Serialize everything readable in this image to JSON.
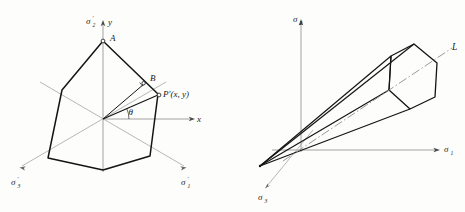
{
  "figure": {
    "background_color": "#fdfdfc",
    "stroke_color": "#1a1a1a",
    "axis_color": "#8a8a8a",
    "construction_color": "#9a9a9a",
    "dashdot_color": "#8d8d8d"
  },
  "left_panel": {
    "name": "deviatoric-pi-plane-hexagon",
    "labels": {
      "sigma2_prime": "σ",
      "sigma2_prime_sub": "2",
      "sigma2_prime_prime_mark": "′",
      "y_axis": "y",
      "x_axis": "x",
      "vertex_A": "A",
      "point_B": "B",
      "point_P": "P′(x, y)",
      "angle_theta": "θ",
      "sigma1_prime": "σ",
      "sigma1_prime_sub": "1",
      "sigma3_prime": "σ",
      "sigma3_prime_sub": "3",
      "prime_mark": "′"
    },
    "axis_labels": [
      {
        "key": "sigma2p",
        "base": "σ",
        "sub": "2",
        "prime": "′"
      },
      {
        "key": "sigma1p",
        "base": "σ",
        "sub": "1",
        "prime": "′"
      },
      {
        "key": "sigma3p",
        "base": "σ",
        "sub": "3",
        "prime": "′"
      }
    ],
    "hexagon_vertices": [
      {
        "x": 103,
        "y": 41
      },
      {
        "x": 158,
        "y": 94
      },
      {
        "x": 150,
        "y": 156
      },
      {
        "x": 103,
        "y": 170
      },
      {
        "x": 48,
        "y": 158
      },
      {
        "x": 62,
        "y": 90
      }
    ],
    "origin": {
      "x": 103,
      "y": 119
    },
    "p_point": {
      "x": 159,
      "y": 95
    },
    "b_point": {
      "x": 143,
      "y": 83
    }
  },
  "right_panel": {
    "name": "principal-stress-space-hexagonal-prism",
    "labels": {
      "sigma1": "σ",
      "sigma1_sub": "1",
      "sigma2": "σ",
      "sigma2_sub": "2",
      "sigma3": "σ",
      "sigma3_sub": "3",
      "hydrostatic_axis": "L"
    },
    "axis_labels": [
      {
        "key": "sigma2",
        "base": "σ",
        "sub": "2"
      },
      {
        "key": "sigma1",
        "base": "σ",
        "sub": "1"
      },
      {
        "key": "sigma3",
        "base": "σ",
        "sub": "3"
      }
    ],
    "apex": {
      "x": 260,
      "y": 166
    },
    "origin": {
      "x": 301,
      "y": 150
    },
    "prism_far_face": [
      {
        "x": 391,
        "y": 56
      },
      {
        "x": 389,
        "y": 90
      },
      {
        "x": 410,
        "y": 109
      },
      {
        "x": 435,
        "y": 97
      },
      {
        "x": 437,
        "y": 63
      },
      {
        "x": 414,
        "y": 44
      }
    ]
  }
}
